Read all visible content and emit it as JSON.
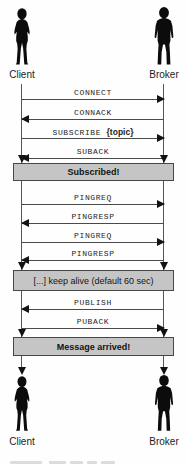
{
  "figure": {
    "type": "sequence-diagram",
    "protocol": "MQTT",
    "background": "#fefefe"
  },
  "actors": {
    "top": [
      {
        "name": "Client",
        "figure": "woman-silhouette-icon"
      },
      {
        "name": "Broker",
        "figure": "man-silhouette-icon"
      }
    ],
    "bottom": [
      {
        "name": "Client",
        "figure": "woman-silhouette-icon"
      },
      {
        "name": "Broker",
        "figure": "man-silhouette-icon"
      }
    ]
  },
  "diagram": {
    "messages": [
      {
        "label": "CONNECT",
        "direction": "right",
        "from": "Client",
        "to": "Broker"
      },
      {
        "label": "CONNACK",
        "direction": "left",
        "from": "Broker",
        "to": "Client"
      },
      {
        "label": "SUBSCRIBE",
        "label_suffix": "{topic}",
        "direction": "right",
        "from": "Client",
        "to": "Broker"
      },
      {
        "label": "SUBACK",
        "direction": "left",
        "from": "Broker",
        "to": "Client"
      },
      {
        "label": "PINGREQ",
        "direction": "right",
        "from": "Client",
        "to": "Broker"
      },
      {
        "label": "PINGRESP",
        "direction": "left",
        "from": "Broker",
        "to": "Client"
      },
      {
        "label": "PINGREQ",
        "direction": "right",
        "from": "Client",
        "to": "Broker"
      },
      {
        "label": "PINGRESP",
        "direction": "left",
        "from": "Broker",
        "to": "Client"
      },
      {
        "label": "PUBLISH",
        "direction": "left",
        "from": "Broker",
        "to": "Client"
      },
      {
        "label": "PUBACK",
        "direction": "right",
        "from": "Client",
        "to": "Broker"
      }
    ],
    "notes": [
      {
        "label": "Subscribed!"
      },
      {
        "label": "[...] keep alive (default 60 sec)"
      },
      {
        "label": "Message arrived!"
      }
    ],
    "colors": {
      "note_fill": "#c5c5c5",
      "note_border": "#474747",
      "line": "#4a4a4a",
      "arrow": "#121212",
      "silhouette": "#0c0c0c"
    }
  }
}
